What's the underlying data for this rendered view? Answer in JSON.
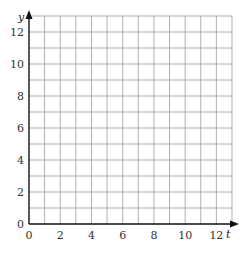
{
  "chart_data": {
    "type": "line",
    "title": "",
    "xlabel": "t",
    "ylabel": "y",
    "xlim": [
      0,
      13
    ],
    "ylim": [
      0,
      13
    ],
    "x_ticks": [
      0,
      2,
      4,
      6,
      8,
      10,
      12
    ],
    "y_ticks": [
      0,
      2,
      4,
      6,
      8,
      10,
      12
    ],
    "grid": true,
    "grid_step": 1,
    "series": []
  },
  "labels": {
    "x_axis": "t",
    "y_axis": "y",
    "x_ticks": [
      "0",
      "2",
      "4",
      "6",
      "8",
      "10",
      "12"
    ],
    "y_ticks": [
      "0",
      "2",
      "4",
      "6",
      "8",
      "10",
      "12"
    ]
  }
}
